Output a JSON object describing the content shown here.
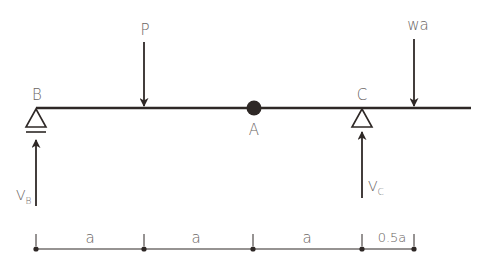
{
  "diagram": {
    "type": "beam-free-body-diagram",
    "colors": {
      "ink": "#2e2826",
      "label": "#6a6563",
      "background": "#ffffff"
    },
    "points": {
      "B": {
        "label": "B",
        "type": "pin-support"
      },
      "A": {
        "label": "A",
        "type": "internal-hinge"
      },
      "C": {
        "label": "C",
        "type": "roller-support"
      }
    },
    "loads": [
      {
        "label": "P",
        "direction": "down",
        "position": "a from B"
      },
      {
        "label": "wa",
        "direction": "down",
        "position": "0.5a right of C"
      }
    ],
    "reactions": [
      {
        "label": "V",
        "subscript": "B",
        "direction": "up"
      },
      {
        "label": "V",
        "subscript": "C",
        "direction": "up"
      }
    ],
    "dimensions": [
      "a",
      "a",
      "a",
      "0.5a"
    ]
  }
}
